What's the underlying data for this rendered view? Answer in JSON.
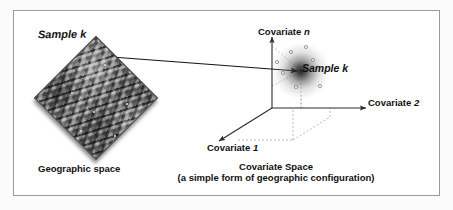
{
  "figure": {
    "width": 453,
    "height": 210,
    "background": "#ffffff",
    "frame_color": "#9a9a9a",
    "ink_color": "#111111"
  },
  "geographic_panel": {
    "sample_label": "Sample k",
    "caption": "Geographic space",
    "terrain": {
      "description": "grayscale shaded-relief digital elevation model block",
      "rotation_deg": 45,
      "sample_dots": [
        {
          "x": 0.58,
          "y": 0.22
        },
        {
          "x": 0.3,
          "y": 0.46
        },
        {
          "x": 0.49,
          "y": 0.62
        },
        {
          "x": 0.76,
          "y": 0.55
        },
        {
          "x": 0.38,
          "y": 0.78
        },
        {
          "x": 0.66,
          "y": 0.82
        }
      ]
    }
  },
  "covariate_panel": {
    "sample_label": "Sample k",
    "caption_line1": "Covariate Space",
    "caption_line2": "(a simple form of geographic configuration)",
    "axes": [
      {
        "name": "covariate-n-axis",
        "label_prefix": "Covariate ",
        "label_italic": "n",
        "direction": "up"
      },
      {
        "name": "covariate-2-axis",
        "label_prefix": "Covariate ",
        "label_italic": "2",
        "direction": "right"
      },
      {
        "name": "covariate-1-axis",
        "label_prefix": "Covariate ",
        "label_italic": "1",
        "direction": "down-left"
      }
    ],
    "origin": {
      "x": 272,
      "y": 108
    },
    "cloud": {
      "center": {
        "x": 301,
        "y": 71
      },
      "style": "radial gradient blob, dark center fading to white"
    },
    "scatter_points": [
      {
        "x": 291,
        "y": 52
      },
      {
        "x": 313,
        "y": 60
      },
      {
        "x": 283,
        "y": 73
      },
      {
        "x": 296,
        "y": 87
      },
      {
        "x": 320,
        "y": 86
      },
      {
        "x": 306,
        "y": 47
      },
      {
        "x": 277,
        "y": 62
      }
    ]
  },
  "connector": {
    "name": "sample-link-arrow",
    "from": {
      "x": 105,
      "y": 57
    },
    "to": {
      "x": 297,
      "y": 71
    },
    "style": "solid black arrow"
  }
}
